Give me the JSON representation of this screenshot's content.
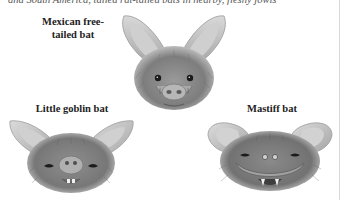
{
  "page": {
    "clipped_top_text": "and South America, tailed rat-tailed bats in nearby, fleshy jowls"
  },
  "figures": [
    {
      "id": "mexican",
      "label": "Mexican free-tailed bat",
      "label_lines": [
        "Mexican free-",
        "tailed bat"
      ],
      "icon": "bat-face-illustration"
    },
    {
      "id": "goblin",
      "label": "Little goblin bat",
      "icon": "bat-face-illustration"
    },
    {
      "id": "mastiff",
      "label": "Mastiff bat",
      "icon": "bat-face-illustration"
    }
  ],
  "colors": {
    "background": "#ffffff",
    "text": "#222222",
    "illustration_light": "#e6e6e6",
    "illustration_mid": "#a8a8a8",
    "illustration_dark": "#5a5a5a",
    "rule": "#d8d8d8"
  }
}
